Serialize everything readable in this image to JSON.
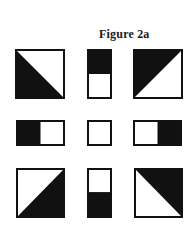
{
  "figure": {
    "title": "Figure 2a",
    "fill_color": "#111111",
    "background_color": "#ffffff",
    "grid": [
      [
        {
          "id": "r1c1",
          "shape": "square",
          "fill": "diagonal-bottom-left-triangle"
        },
        {
          "id": "r1c2",
          "shape": "tall-rectangle",
          "fill": "top-half"
        },
        {
          "id": "r1c3",
          "shape": "square",
          "fill": "diagonal-top-left-triangle"
        }
      ],
      [
        {
          "id": "r2c1",
          "shape": "wide-rectangle",
          "fill": "left-half"
        },
        {
          "id": "r2c2",
          "shape": "small-square",
          "fill": "empty"
        },
        {
          "id": "r2c3",
          "shape": "wide-rectangle",
          "fill": "right-half"
        }
      ],
      [
        {
          "id": "r3c1",
          "shape": "square",
          "fill": "diagonal-bottom-right-triangle"
        },
        {
          "id": "r3c2",
          "shape": "tall-rectangle",
          "fill": "bottom-half"
        },
        {
          "id": "r3c3",
          "shape": "square",
          "fill": "diagonal-top-right-triangle"
        }
      ]
    ]
  }
}
